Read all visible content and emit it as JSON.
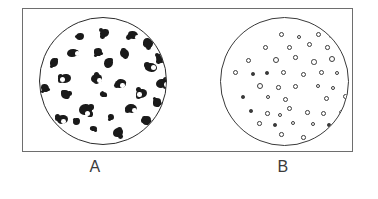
{
  "figure": {
    "background_color": "#ffffff",
    "frame_color": "#6e6e6e"
  },
  "panels": [
    {
      "id": "A",
      "label": "A",
      "dish_outline_color": "#2b2b2b",
      "colony_color": "#1a1a1a",
      "colony_style": "large-dark-irregular",
      "colony_count": 28,
      "colonies": [
        {
          "x": 60,
          "y": 11,
          "w": 9,
          "h": 8,
          "hl": null
        },
        {
          "x": 36,
          "y": 15,
          "w": 8,
          "h": 7,
          "hl": null
        },
        {
          "x": 88,
          "y": 13,
          "w": 10,
          "h": 8,
          "hl": {
            "x": 7,
            "y": 4,
            "r": 2.4
          }
        },
        {
          "x": 103,
          "y": 20,
          "w": 10,
          "h": 10,
          "hl": null
        },
        {
          "x": 27,
          "y": 31,
          "w": 11,
          "h": 8,
          "hl": {
            "x": 8,
            "y": 2,
            "r": 2.6
          }
        },
        {
          "x": 54,
          "y": 30,
          "w": 8,
          "h": 8,
          "hl": null
        },
        {
          "x": 80,
          "y": 31,
          "w": 9,
          "h": 9,
          "hl": null
        },
        {
          "x": 10,
          "y": 40,
          "w": 8,
          "h": 9,
          "hl": null
        },
        {
          "x": 64,
          "y": 40,
          "w": 9,
          "h": 10,
          "hl": null
        },
        {
          "x": 116,
          "y": 36,
          "w": 9,
          "h": 9,
          "hl": null
        },
        {
          "x": 105,
          "y": 45,
          "w": 12,
          "h": 9,
          "hl": {
            "x": 6,
            "y": 2,
            "r": 2.5
          }
        },
        {
          "x": 20,
          "y": 56,
          "w": 11,
          "h": 9,
          "hl": {
            "x": 0,
            "y": 3,
            "r": 2.5
          }
        },
        {
          "x": 51,
          "y": 56,
          "w": 11,
          "h": 9,
          "hl": {
            "x": 6,
            "y": 4,
            "r": 2.4
          }
        },
        {
          "x": 1,
          "y": 66,
          "w": 8,
          "h": 8,
          "hl": null
        },
        {
          "x": 76,
          "y": 61,
          "w": 10,
          "h": 9,
          "hl": {
            "x": 4,
            "y": 4,
            "r": 2.3
          }
        },
        {
          "x": 116,
          "y": 61,
          "w": 11,
          "h": 9,
          "hl": {
            "x": 8,
            "y": 3,
            "r": 2.3
          }
        },
        {
          "x": 21,
          "y": 72,
          "w": 9,
          "h": 9,
          "hl": null
        },
        {
          "x": 60,
          "y": 74,
          "w": 7,
          "h": 5,
          "hl": null
        },
        {
          "x": 96,
          "y": 71,
          "w": 11,
          "h": 9,
          "hl": {
            "x": 1,
            "y": 3,
            "r": 2.3
          }
        },
        {
          "x": 39,
          "y": 86,
          "w": 12,
          "h": 11,
          "hl": {
            "x": 6,
            "y": 7,
            "r": 2.5
          }
        },
        {
          "x": 86,
          "y": 86,
          "w": 11,
          "h": 9,
          "hl": {
            "x": 6,
            "y": 4,
            "r": 2.4
          }
        },
        {
          "x": 113,
          "y": 80,
          "w": 8,
          "h": 9,
          "hl": null
        },
        {
          "x": 17,
          "y": 97,
          "w": 11,
          "h": 9,
          "hl": {
            "x": 4,
            "y": 4,
            "r": 2.4
          }
        },
        {
          "x": 102,
          "y": 98,
          "w": 9,
          "h": 9,
          "hl": null
        },
        {
          "x": 50,
          "y": 108,
          "w": 7,
          "h": 5,
          "hl": null
        },
        {
          "x": 73,
          "y": 110,
          "w": 10,
          "h": 9,
          "hl": null
        },
        {
          "x": 33,
          "y": 100,
          "w": 7,
          "h": 7,
          "hl": null
        },
        {
          "x": 68,
          "y": 96,
          "w": 6,
          "h": 6,
          "hl": null
        }
      ]
    },
    {
      "id": "B",
      "label": "B",
      "dish_outline_color": "#3a3a3a",
      "colony_color": "#3c3c3c",
      "colony_style": "small-open-rings",
      "colony_count": 48,
      "colonies": [
        {
          "x": 58,
          "y": 14,
          "d": 5,
          "filled": false
        },
        {
          "x": 76,
          "y": 17,
          "d": 4,
          "filled": false
        },
        {
          "x": 95,
          "y": 14,
          "d": 5,
          "filled": false
        },
        {
          "x": 108,
          "y": 16,
          "d": 3.5,
          "filled": true
        },
        {
          "x": 117,
          "y": 12,
          "d": 5,
          "filled": false
        },
        {
          "x": 42,
          "y": 27,
          "d": 5,
          "filled": false
        },
        {
          "x": 66,
          "y": 27,
          "d": 5,
          "filled": false
        },
        {
          "x": 86,
          "y": 24,
          "d": 5,
          "filled": false
        },
        {
          "x": 104,
          "y": 27,
          "d": 4.5,
          "filled": false
        },
        {
          "x": 121,
          "y": 24,
          "d": 5,
          "filled": false
        },
        {
          "x": 25,
          "y": 40,
          "d": 5,
          "filled": false
        },
        {
          "x": 52,
          "y": 39,
          "d": 6,
          "filled": false
        },
        {
          "x": 72,
          "y": 37,
          "d": 4.5,
          "filled": false
        },
        {
          "x": 90,
          "y": 41,
          "d": 5.5,
          "filled": false
        },
        {
          "x": 108,
          "y": 38,
          "d": 6,
          "filled": false
        },
        {
          "x": 124,
          "y": 39,
          "d": 5.5,
          "filled": false
        },
        {
          "x": 12,
          "y": 52,
          "d": 5,
          "filled": false
        },
        {
          "x": 30,
          "y": 54,
          "d": 3.5,
          "filled": true
        },
        {
          "x": 44,
          "y": 53,
          "d": 3.5,
          "filled": true
        },
        {
          "x": 60,
          "y": 52,
          "d": 5,
          "filled": false
        },
        {
          "x": 80,
          "y": 54,
          "d": 5,
          "filled": false
        },
        {
          "x": 98,
          "y": 52,
          "d": 5,
          "filled": false
        },
        {
          "x": 114,
          "y": 53,
          "d": 4,
          "filled": false
        },
        {
          "x": 130,
          "y": 52,
          "d": 3.5,
          "filled": true
        },
        {
          "x": 36,
          "y": 65,
          "d": 6,
          "filled": false
        },
        {
          "x": 55,
          "y": 67,
          "d": 4.5,
          "filled": false
        },
        {
          "x": 72,
          "y": 66,
          "d": 5,
          "filled": false
        },
        {
          "x": 95,
          "y": 66,
          "d": 4,
          "filled": false
        },
        {
          "x": 110,
          "y": 68,
          "d": 4,
          "filled": false
        },
        {
          "x": 20,
          "y": 77,
          "d": 3.5,
          "filled": true
        },
        {
          "x": 45,
          "y": 77,
          "d": 4,
          "filled": false
        },
        {
          "x": 62,
          "y": 79,
          "d": 5,
          "filled": false
        },
        {
          "x": 103,
          "y": 78,
          "d": 5,
          "filled": false
        },
        {
          "x": 122,
          "y": 76,
          "d": 5,
          "filled": false
        },
        {
          "x": 66,
          "y": 88,
          "d": 5,
          "filled": false
        },
        {
          "x": 28,
          "y": 91,
          "d": 3.5,
          "filled": true
        },
        {
          "x": 44,
          "y": 93,
          "d": 4.5,
          "filled": false
        },
        {
          "x": 57,
          "y": 95,
          "d": 4,
          "filled": false
        },
        {
          "x": 84,
          "y": 92,
          "d": 4.5,
          "filled": false
        },
        {
          "x": 100,
          "y": 93,
          "d": 5,
          "filled": false
        },
        {
          "x": 118,
          "y": 92,
          "d": 5,
          "filled": false
        },
        {
          "x": 36,
          "y": 103,
          "d": 4.5,
          "filled": false
        },
        {
          "x": 52,
          "y": 105,
          "d": 3.5,
          "filled": true
        },
        {
          "x": 70,
          "y": 103,
          "d": 4,
          "filled": false
        },
        {
          "x": 90,
          "y": 104,
          "d": 4,
          "filled": false
        },
        {
          "x": 106,
          "y": 105,
          "d": 3.5,
          "filled": true
        },
        {
          "x": 58,
          "y": 114,
          "d": 4.5,
          "filled": false
        },
        {
          "x": 80,
          "y": 117,
          "d": 4.5,
          "filled": false
        }
      ]
    }
  ]
}
